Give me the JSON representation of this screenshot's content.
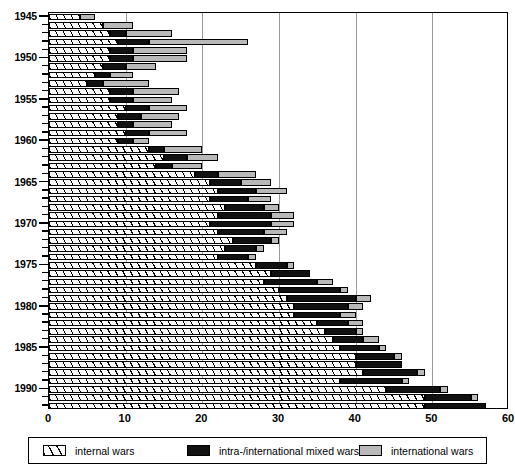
{
  "chart_data": {
    "type": "bar",
    "orientation": "horizontal",
    "stacked": true,
    "title": "",
    "xlabel": "",
    "ylabel": "",
    "xlim": [
      0,
      60
    ],
    "xticks": [
      0,
      10,
      20,
      30,
      40,
      50,
      60
    ],
    "gridlines": [
      10,
      20,
      30,
      40,
      50
    ],
    "grid": true,
    "ytick_labels": [
      "1945",
      "1950",
      "1955",
      "1960",
      "1965",
      "1970",
      "1975",
      "1980",
      "1985",
      "1990"
    ],
    "ytick_years": [
      1945,
      1950,
      1955,
      1960,
      1965,
      1970,
      1975,
      1980,
      1985,
      1990
    ],
    "categories": [
      1945,
      1946,
      1947,
      1948,
      1949,
      1950,
      1951,
      1952,
      1953,
      1954,
      1955,
      1956,
      1957,
      1958,
      1959,
      1960,
      1961,
      1962,
      1963,
      1964,
      1965,
      1966,
      1967,
      1968,
      1969,
      1970,
      1971,
      1972,
      1973,
      1974,
      1975,
      1976,
      1977,
      1978,
      1979,
      1980,
      1981,
      1982,
      1983,
      1984,
      1985,
      1986,
      1987,
      1988,
      1989,
      1990,
      1991,
      1992
    ],
    "legend_position": "bottom",
    "series": [
      {
        "name": "internal wars",
        "pattern": "hatched",
        "color": "#ffffff",
        "values": [
          4,
          7,
          8,
          9,
          8,
          8,
          7,
          6,
          5,
          8,
          8,
          10,
          9,
          9,
          10,
          9,
          13,
          15,
          14,
          19,
          21,
          22,
          21,
          23,
          22,
          21,
          22,
          24,
          23,
          22,
          27,
          29,
          28,
          30,
          31,
          32,
          32,
          35,
          36,
          37,
          38,
          40,
          40,
          41,
          38,
          44,
          49,
          49
        ]
      },
      {
        "name": "intra-/international mixed wars",
        "pattern": "solid",
        "color": "#111111",
        "values": [
          0,
          0,
          2,
          4,
          3,
          3,
          3,
          2,
          2,
          3,
          3,
          3,
          3,
          2,
          3,
          2,
          2,
          3,
          2,
          3,
          4,
          5,
          5,
          5,
          7,
          8,
          6,
          5,
          4,
          4,
          4,
          5,
          7,
          8,
          9,
          7,
          6,
          4,
          4,
          4,
          5,
          5,
          6,
          7,
          8,
          7,
          6,
          8
        ]
      },
      {
        "name": "international wars",
        "pattern": "solid",
        "color": "#b9b9b9",
        "values": [
          2,
          4,
          6,
          13,
          7,
          7,
          4,
          3,
          6,
          6,
          5,
          5,
          5,
          5,
          5,
          2,
          5,
          4,
          4,
          5,
          4,
          4,
          3,
          2,
          3,
          3,
          3,
          1,
          1,
          1,
          1,
          0,
          2,
          1,
          2,
          2,
          2,
          2,
          1,
          2,
          1,
          1,
          0,
          1,
          1,
          1,
          1,
          0
        ]
      }
    ]
  },
  "legend": {
    "items": [
      {
        "label": "internal wars",
        "swatch": "hatched-swatch"
      },
      {
        "label": "intra-/international mixed wars",
        "swatch": "black-swatch"
      },
      {
        "label": "international wars",
        "swatch": "gray-swatch"
      }
    ]
  }
}
